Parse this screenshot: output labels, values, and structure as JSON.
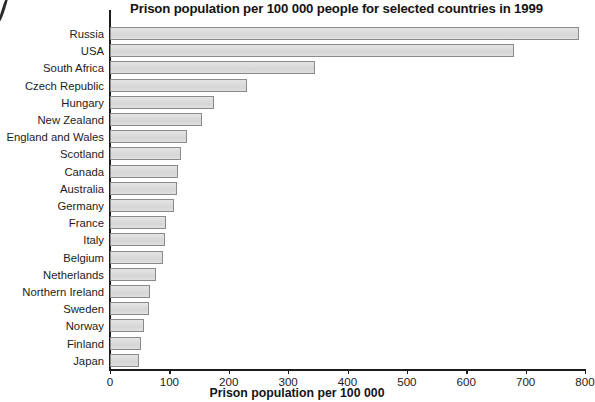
{
  "chart_data": {
    "type": "bar",
    "orientation": "horizontal",
    "title": "Prison population per 100 000 people for selected countries in 1999",
    "xlabel": "Prison population per 100 000",
    "ylabel": "",
    "xlim": [
      0,
      800
    ],
    "xticks": [
      0,
      100,
      200,
      300,
      400,
      500,
      600,
      700,
      800
    ],
    "xtick_labels": [
      "0",
      "100",
      "200",
      "300",
      "400",
      "500",
      "600",
      "700",
      "800"
    ],
    "grid": false,
    "legend": null,
    "bar_fill_color": "#dcdcdc",
    "bar_border_color": "#8a8a8a",
    "axis_color": "#1c1c1c",
    "categories": [
      "Russia",
      "USA",
      "South Africa",
      "Czech Republic",
      "Hungary",
      "New Zealand",
      "England and Wales",
      "Scotland",
      "Canada",
      "Australia",
      "Germany",
      "France",
      "Italy",
      "Belgium",
      "Netherlands",
      "Northern Ireland",
      "Sweden",
      "Norway",
      "Finland",
      "Japan"
    ],
    "values": [
      790,
      680,
      345,
      230,
      175,
      155,
      130,
      120,
      115,
      112,
      107,
      95,
      93,
      90,
      78,
      68,
      65,
      57,
      53,
      48
    ]
  }
}
